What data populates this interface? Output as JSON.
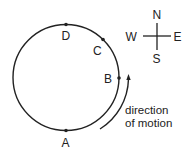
{
  "diagram": {
    "type": "circular-orbit",
    "points": [
      {
        "label": "A",
        "position": "bottom"
      },
      {
        "label": "B",
        "position": "right"
      },
      {
        "label": "C",
        "position": "upper-right"
      },
      {
        "label": "D",
        "position": "top"
      }
    ],
    "compass": {
      "north": "N",
      "south": "S",
      "east": "E",
      "west": "W"
    },
    "motion_label_line1": "direction",
    "motion_label_line2": "of motion",
    "colors": {
      "stroke": "#222222",
      "background": "#ffffff"
    }
  }
}
